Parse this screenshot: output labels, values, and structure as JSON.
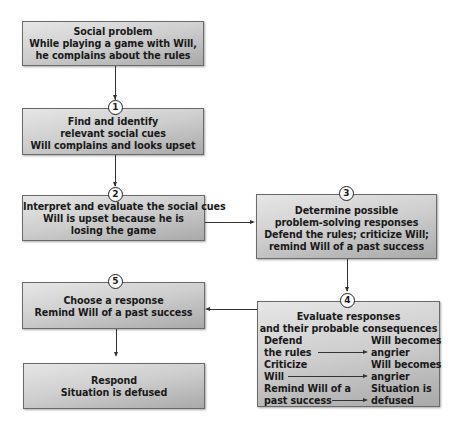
{
  "diagram": {
    "type": "flowchart",
    "colors": {
      "box_light": "#e6e6e6",
      "box_dark": "#a9a9a9",
      "border": "#6a6a6a",
      "line": "#333333"
    },
    "nodes": [
      {
        "id": "social_problem",
        "step": null,
        "lines": [
          "Social problem",
          "While playing a game with Will,",
          "he complains about the rules"
        ]
      },
      {
        "id": "identify_cues",
        "step": "1",
        "lines": [
          "Find and identify",
          "relevant social cues",
          "Will complains and looks upset"
        ]
      },
      {
        "id": "interpret_cues",
        "step": "2",
        "lines": [
          "Interpret and evaluate the social cues",
          "Will is upset because he is",
          "losing the game"
        ]
      },
      {
        "id": "determine_responses",
        "step": "3",
        "lines": [
          "Determine possible",
          "problem-solving responses",
          "Defend the rules; criticize Will;",
          "remind Will of a past success"
        ]
      },
      {
        "id": "evaluate_responses",
        "step": "4",
        "lines": [
          "Evaluate responses",
          "and their probable consequences"
        ],
        "pairs": [
          {
            "response": [
              "Defend",
              "the rules"
            ],
            "consequence": [
              "Will becomes",
              "angrier"
            ]
          },
          {
            "response": [
              "Criticize",
              "Will"
            ],
            "consequence": [
              "Will becomes",
              "angrier"
            ]
          },
          {
            "response": [
              "Remind Will of a",
              "past success"
            ],
            "consequence": [
              "Situation is",
              "defused"
            ]
          }
        ]
      },
      {
        "id": "choose_response",
        "step": "5",
        "lines": [
          "Choose a response",
          "Remind Will of a past success"
        ]
      },
      {
        "id": "respond",
        "step": null,
        "lines": [
          "Respond",
          "Situation is defused"
        ]
      }
    ],
    "edges": [
      [
        "social_problem",
        "identify_cues"
      ],
      [
        "identify_cues",
        "interpret_cues"
      ],
      [
        "interpret_cues",
        "determine_responses"
      ],
      [
        "determine_responses",
        "evaluate_responses"
      ],
      [
        "evaluate_responses",
        "choose_response"
      ],
      [
        "choose_response",
        "respond"
      ]
    ]
  }
}
